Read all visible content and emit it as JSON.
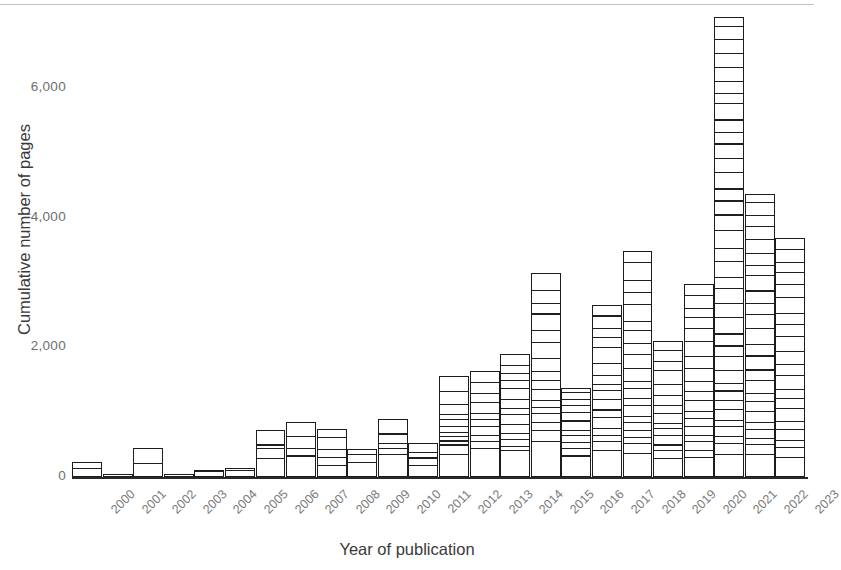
{
  "chart_data": {
    "type": "bar",
    "title": "",
    "subtitle": "",
    "xlabel": "Year of publication",
    "ylabel": "Cumulative number of pages",
    "categories": [
      "2000",
      "2001",
      "2002",
      "2003",
      "2004",
      "2005",
      "2006",
      "2007",
      "2008",
      "2009",
      "2010",
      "2011",
      "2012",
      "2013",
      "2014",
      "2015",
      "2016",
      "2017",
      "2018",
      "2019",
      "2020",
      "2021",
      "2022",
      "2023"
    ],
    "values": [
      230,
      20,
      450,
      40,
      110,
      140,
      730,
      850,
      740,
      430,
      900,
      530,
      1560,
      1630,
      1890,
      3150,
      1380,
      2660,
      3480,
      2100,
      2970,
      7100,
      4370,
      3680
    ],
    "ylim": [
      0,
      7400
    ],
    "ytick_values": [
      0,
      2000,
      4000,
      6000
    ],
    "ytick_labels": [
      "0",
      "2,000",
      "4,000",
      "6,000"
    ],
    "grid": false,
    "legend": false,
    "legend_position": "none",
    "note": "Each bar is a stacked column subdivided into many thin segments, one per publication; segment heights equal individual page counts.",
    "segments_per_year": [
      [
        110,
        120
      ],
      [
        20
      ],
      [
        180,
        270
      ],
      [
        40
      ],
      [
        55,
        55
      ],
      [
        70,
        70
      ],
      [
        260,
        150,
        60,
        260
      ],
      [
        300,
        120,
        180,
        250
      ],
      [
        150,
        130,
        120,
        180,
        160
      ],
      [
        200,
        120,
        110
      ],
      [
        330,
        90,
        80,
        140,
        260
      ],
      [
        160,
        110,
        90,
        170
      ],
      [
        330,
        140,
        60,
        70,
        60,
        90,
        110,
        80,
        150,
        200,
        270
      ],
      [
        420,
        110,
        90,
        140,
        110,
        80,
        170,
        150,
        160,
        200
      ],
      [
        380,
        70,
        110,
        90,
        130,
        160,
        90,
        140,
        170,
        120,
        110,
        120,
        200
      ],
      [
        520,
        180,
        120,
        140,
        90,
        110,
        170,
        130,
        150,
        200,
        240,
        180,
        260,
        160,
        200,
        300
      ],
      [
        300,
        120,
        90,
        110,
        70,
        150,
        130,
        110,
        90,
        110,
        100
      ],
      [
        380,
        140,
        90,
        120,
        170,
        110,
        160,
        140,
        100,
        130,
        190,
        240,
        160,
        130,
        200,
        200
      ],
      [
        340,
        150,
        90,
        110,
        130,
        80,
        170,
        120,
        150,
        110,
        190,
        220,
        170,
        200,
        140,
        260,
        190,
        180,
        280,
        190
      ],
      [
        260,
        120,
        90,
        140,
        110,
        80,
        160,
        120,
        150,
        180,
        210,
        140,
        170,
        170
      ],
      [
        280,
        110,
        130,
        90,
        150,
        120,
        100,
        170,
        140,
        160,
        200,
        180,
        240,
        190,
        170,
        150,
        190,
        200
      ],
      [
        300,
        150,
        110,
        130,
        90,
        160,
        120,
        140,
        110,
        180,
        200,
        150,
        170,
        240,
        190,
        210,
        160,
        230,
        180,
        260,
        220,
        200,
        170,
        240,
        190,
        210,
        160,
        180,
        230,
        150,
        170,
        200,
        190,
        210,
        180,
        160
      ],
      [
        320,
        140,
        100,
        130,
        110,
        170,
        150,
        120,
        190,
        160,
        210,
        180,
        240,
        200,
        170,
        190,
        230,
        160,
        180,
        210,
        190,
        170,
        200,
        150
      ],
      [
        280,
        150,
        110,
        170,
        130,
        190,
        160,
        140,
        210,
        180,
        200,
        230,
        190,
        170,
        240,
        210,
        180,
        160,
        200,
        190
      ]
    ]
  }
}
